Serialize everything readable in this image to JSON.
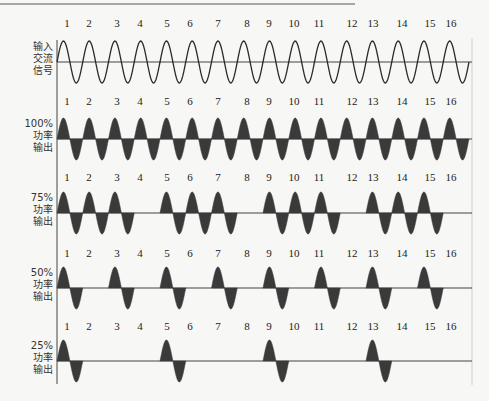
{
  "diagram": {
    "cycle_numbers": [
      "1",
      "2",
      "3",
      "4",
      "5",
      "6",
      "7",
      "8",
      "9",
      "10",
      "11",
      "12",
      "13",
      "14",
      "15",
      "16"
    ],
    "rows": [
      {
        "id": "input",
        "label_lines": [
          "输入",
          "交流",
          "信号"
        ],
        "style": "outline",
        "active_cycles": [
          1,
          2,
          3,
          4,
          5,
          6,
          7,
          8,
          9,
          10,
          11,
          12,
          13,
          14,
          15,
          16
        ]
      },
      {
        "id": "power-100",
        "label_lines": [
          "100%",
          "功率",
          "输出"
        ],
        "style": "filled",
        "power_percent": 100,
        "active_cycles": [
          1,
          2,
          3,
          4,
          5,
          6,
          7,
          8,
          9,
          10,
          11,
          12,
          13,
          14,
          15,
          16
        ]
      },
      {
        "id": "power-75",
        "label_lines": [
          "75%",
          "功率",
          "输出"
        ],
        "style": "filled",
        "power_percent": 75,
        "active_cycles": [
          1,
          2,
          3,
          5,
          6,
          7,
          9,
          10,
          11,
          13,
          14,
          15
        ]
      },
      {
        "id": "power-50",
        "label_lines": [
          "50%",
          "功率",
          "输出"
        ],
        "style": "filled",
        "power_percent": 50,
        "active_cycles": [
          1,
          3,
          5,
          7,
          9,
          11,
          13,
          15
        ]
      },
      {
        "id": "power-25",
        "label_lines": [
          "25%",
          "功率",
          "输出"
        ],
        "style": "filled",
        "power_percent": 25,
        "active_cycles": [
          1,
          5,
          9,
          13
        ]
      }
    ],
    "colors": {
      "line": "#2a2a2a",
      "fill": "#3a3a3a",
      "axis": "#444444",
      "frame": "#cfcfcf",
      "background": "#f7f7f5"
    }
  }
}
